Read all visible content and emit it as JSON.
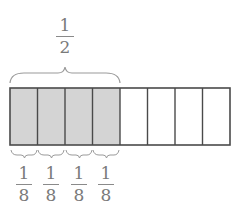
{
  "diagram": {
    "type": "fraction-bar",
    "total_parts": 8,
    "shaded_parts": 4,
    "colors": {
      "shaded": "#d4d4d4",
      "unshaded": "#ffffff",
      "stroke": "#4a4a4a",
      "text": "#7a7a7a"
    },
    "top_label": {
      "numerator": "1",
      "denominator": "2"
    },
    "bottom_labels": [
      {
        "numerator": "1",
        "denominator": "8"
      },
      {
        "numerator": "1",
        "denominator": "8"
      },
      {
        "numerator": "1",
        "denominator": "8"
      },
      {
        "numerator": "1",
        "denominator": "8"
      }
    ]
  }
}
